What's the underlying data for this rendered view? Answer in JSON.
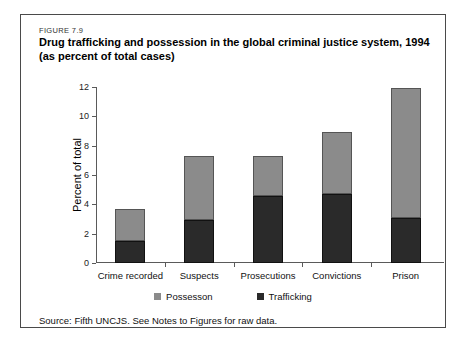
{
  "figure": {
    "number": "FIGURE 7.9",
    "title_line1": "Drug trafficking and possession in the global criminal justice system, 1994",
    "title_line2": "(as percent of total cases)",
    "source": "Source: Fifth UNCJS. See Notes to Figures for raw data."
  },
  "legend": {
    "possession_label": "Possesson",
    "trafficking_label": "Trafficking"
  },
  "colors": {
    "possession": "#8b8b8b",
    "trafficking": "#2a2a2a",
    "axis": "#5a5a5a",
    "frame": "#4a4a4a"
  },
  "chart_data": {
    "type": "bar",
    "stacked": true,
    "title": "Drug trafficking and possession in the global criminal justice system, 1994 (as percent of total cases)",
    "xlabel": "",
    "ylabel": "Percent of total",
    "ylim": [
      0,
      12
    ],
    "yticks": [
      0,
      2,
      4,
      6,
      8,
      10,
      12
    ],
    "ytick_labels": [
      "0",
      "2",
      "4",
      "6",
      "8",
      "10",
      "12"
    ],
    "grid": false,
    "legend_position": "bottom",
    "categories": [
      "Crime recorded",
      "Suspects",
      "Prosecutions",
      "Convictions",
      "Prison"
    ],
    "series": [
      {
        "name": "Trafficking",
        "values": [
          1.5,
          2.9,
          4.6,
          4.7,
          3.1
        ]
      },
      {
        "name": "Possesson",
        "values": [
          2.2,
          4.4,
          2.7,
          4.2,
          8.8
        ]
      }
    ],
    "totals": [
      3.7,
      7.3,
      7.3,
      8.9,
      11.9
    ]
  }
}
